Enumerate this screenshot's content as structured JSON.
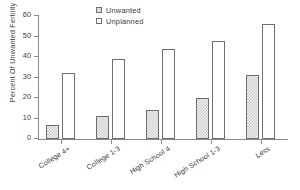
{
  "chart_data": {
    "type": "bar",
    "title": "",
    "subtitle": "",
    "xlabel": "",
    "ylabel": "Percent Of Unwanted Fertility",
    "ylim": [
      0,
      60
    ],
    "yticks": [
      0,
      10,
      20,
      30,
      40,
      50,
      60
    ],
    "ytick_labels": [
      "0",
      "10",
      "20",
      "30",
      "40",
      "50",
      "60"
    ],
    "grid": false,
    "legend_position": "top-center",
    "categories": [
      "College 4+",
      "College 1-3",
      "High School 4",
      "High School 1-3",
      "Less"
    ],
    "series": [
      {
        "name": "Unwanted",
        "values": [
          7,
          11,
          14,
          20,
          31
        ],
        "fill": "#ededed",
        "pattern": "stipple",
        "edge_color": "#6e6e6e"
      },
      {
        "name": "Unplanned",
        "values": [
          32,
          39,
          44,
          48,
          56
        ],
        "fill": "#ffffff",
        "pattern": "none",
        "edge_color": "#6e6e6e"
      }
    ]
  },
  "legend": {
    "items": [
      {
        "label": "Unwanted"
      },
      {
        "label": "Unplanned"
      }
    ]
  },
  "colors": {
    "axis": "#8a8a8a",
    "text": "#3a3a3a",
    "bar_edge": "#6e6e6e",
    "unwanted_fill": "#ededed",
    "unplanned_fill": "#ffffff",
    "background": "#ffffff"
  }
}
